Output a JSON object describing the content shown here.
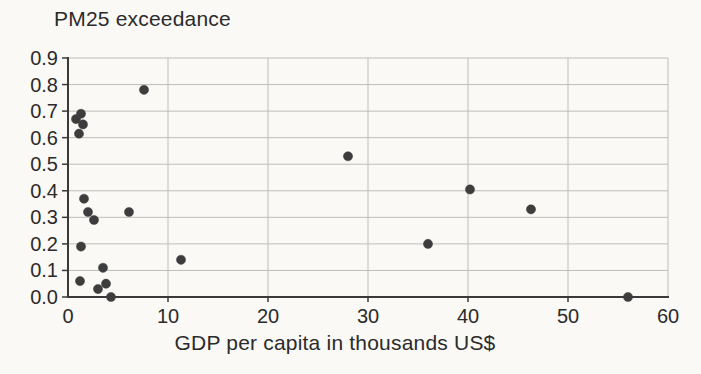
{
  "chart_data": {
    "type": "scatter",
    "title": "PM25 exceedance",
    "xlabel": "GDP per capita in thousands US$",
    "ylabel": "PM25 exceedance",
    "xlim": [
      0,
      60
    ],
    "ylim": [
      0.0,
      0.9
    ],
    "xticks": [
      0,
      10,
      20,
      30,
      40,
      50,
      60
    ],
    "xtick_labels": [
      "0",
      "10",
      "20",
      "30",
      "40",
      "50",
      "60"
    ],
    "yticks": [
      0.0,
      0.1,
      0.2,
      0.3,
      0.4,
      0.5,
      0.6,
      0.7,
      0.8,
      0.9
    ],
    "ytick_labels": [
      "0.0",
      "0.1",
      "0.2",
      "0.3",
      "0.4",
      "0.5",
      "0.6",
      "0.7",
      "0.8",
      "0.9"
    ],
    "grid": true,
    "legend": null,
    "points": [
      {
        "x": 0.8,
        "y": 0.67
      },
      {
        "x": 1.1,
        "y": 0.615
      },
      {
        "x": 1.3,
        "y": 0.69
      },
      {
        "x": 1.5,
        "y": 0.65
      },
      {
        "x": 1.2,
        "y": 0.06
      },
      {
        "x": 1.3,
        "y": 0.19
      },
      {
        "x": 1.6,
        "y": 0.37
      },
      {
        "x": 2.0,
        "y": 0.32
      },
      {
        "x": 2.6,
        "y": 0.29
      },
      {
        "x": 3.0,
        "y": 0.03
      },
      {
        "x": 3.5,
        "y": 0.11
      },
      {
        "x": 3.8,
        "y": 0.05
      },
      {
        "x": 4.3,
        "y": 0.0
      },
      {
        "x": 6.1,
        "y": 0.32
      },
      {
        "x": 7.6,
        "y": 0.78
      },
      {
        "x": 11.3,
        "y": 0.14
      },
      {
        "x": 28.0,
        "y": 0.53
      },
      {
        "x": 36.0,
        "y": 0.2
      },
      {
        "x": 40.2,
        "y": 0.405
      },
      {
        "x": 46.3,
        "y": 0.33
      },
      {
        "x": 56.0,
        "y": 0.0
      }
    ],
    "colors": {
      "point": "#3d3d3d",
      "grid": "#bdbdba",
      "axis": "#3a3a3a",
      "text": "#2b2b2b",
      "paper": "#faf9f6"
    }
  }
}
